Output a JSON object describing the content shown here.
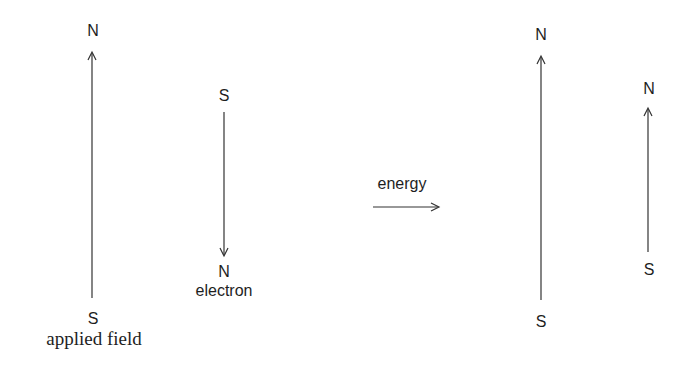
{
  "diagram": {
    "type": "magnetic-moment-alignment",
    "before": {
      "applied_field": {
        "top_label": "N",
        "bottom_label": "S",
        "caption": "applied field",
        "direction": "up"
      },
      "electron": {
        "top_label": "S",
        "bottom_label": "N",
        "caption": "electron",
        "direction": "down"
      }
    },
    "transition": {
      "label": "energy",
      "direction": "right"
    },
    "after": {
      "applied_field": {
        "top_label": "N",
        "bottom_label": "S",
        "direction": "up"
      },
      "electron": {
        "top_label": "N",
        "bottom_label": "S",
        "direction": "up"
      }
    },
    "colors": {
      "ink": "#1e1e1e",
      "line": "#333333",
      "background": "#ffffff"
    }
  }
}
